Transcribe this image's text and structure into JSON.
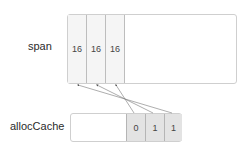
{
  "diagram": {
    "span": {
      "label": "span",
      "cells": [
        "16",
        "16",
        "16"
      ]
    },
    "allocCache": {
      "label": "allocCache",
      "cells": [
        "0",
        "1",
        "1"
      ]
    },
    "arrows": [
      {
        "from": "allocCache.cell0",
        "to": "span.cell2"
      },
      {
        "from": "allocCache.cell1",
        "to": "span.cell1"
      },
      {
        "from": "allocCache.cell2",
        "to": "span.cell0"
      }
    ],
    "colors": {
      "border": "#cfcfcf",
      "span_cell_fill": "#f5f5f5",
      "alloc_cell_fill": "#e3e3e3",
      "arrow": "#555555"
    }
  }
}
